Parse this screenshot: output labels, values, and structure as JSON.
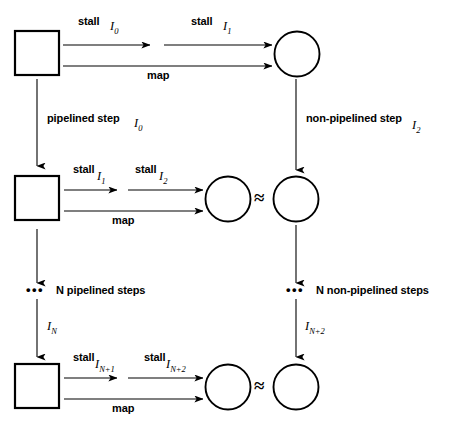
{
  "diagram": {
    "colors": {
      "stroke": "#000000",
      "background": "#ffffff"
    },
    "rows": [
      {
        "id": "row-top",
        "square": {
          "name": "state-square-top"
        },
        "circle_left": {
          "name": "state-circle-top"
        },
        "arrow_labels": [
          {
            "word": "stall",
            "instr": "I",
            "sub": "0"
          },
          {
            "word": "stall",
            "instr": "I",
            "sub": "1"
          }
        ],
        "map_label": "map"
      },
      {
        "id": "row-middle",
        "square": {
          "name": "state-square-middle"
        },
        "circle_left": {
          "name": "state-circle-middle-left"
        },
        "circle_right": {
          "name": "state-circle-middle-right"
        },
        "equiv": "≈",
        "arrow_labels": [
          {
            "word": "stall",
            "instr": "I",
            "sub": "1"
          },
          {
            "word": "stall",
            "instr": "I",
            "sub": "2"
          }
        ],
        "map_label": "map"
      },
      {
        "id": "row-bottom",
        "square": {
          "name": "state-square-bottom"
        },
        "circle_left": {
          "name": "state-circle-bottom-left"
        },
        "circle_right": {
          "name": "state-circle-bottom-right"
        },
        "equiv": "≈",
        "arrow_labels": [
          {
            "word": "stall",
            "instr": "I",
            "sub": "N+1"
          },
          {
            "word": "stall",
            "instr": "I",
            "sub": "N+2"
          }
        ],
        "map_label": "map"
      }
    ],
    "vertical_steps": [
      {
        "id": "step-left-1",
        "label": "pipelined step",
        "instr": "I",
        "sub": "0"
      },
      {
        "id": "step-right-1",
        "label": "non-pipelined step",
        "instr": "I",
        "sub": "2"
      },
      {
        "id": "step-left-2",
        "ellipsis": "•••",
        "label": "N pipelined steps",
        "instr": "I",
        "sub": "N"
      },
      {
        "id": "step-right-2",
        "ellipsis": "•••",
        "label": "N non-pipelined steps",
        "instr": "I",
        "sub": "N+2"
      }
    ]
  }
}
